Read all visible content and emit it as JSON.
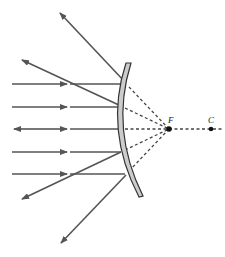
{
  "diagram": {
    "labels": {
      "focal_point": "F",
      "center_of_curvature": "C"
    },
    "colors": {
      "ray": "#555555",
      "mirror_fill": "#cccccc",
      "mirror_edge": "#333333",
      "dashed": "#444444"
    },
    "incident_ray_y": [
      84,
      107,
      129,
      152,
      174
    ],
    "focal_point_x": 169,
    "center_x": 211,
    "axis_y": 129
  }
}
